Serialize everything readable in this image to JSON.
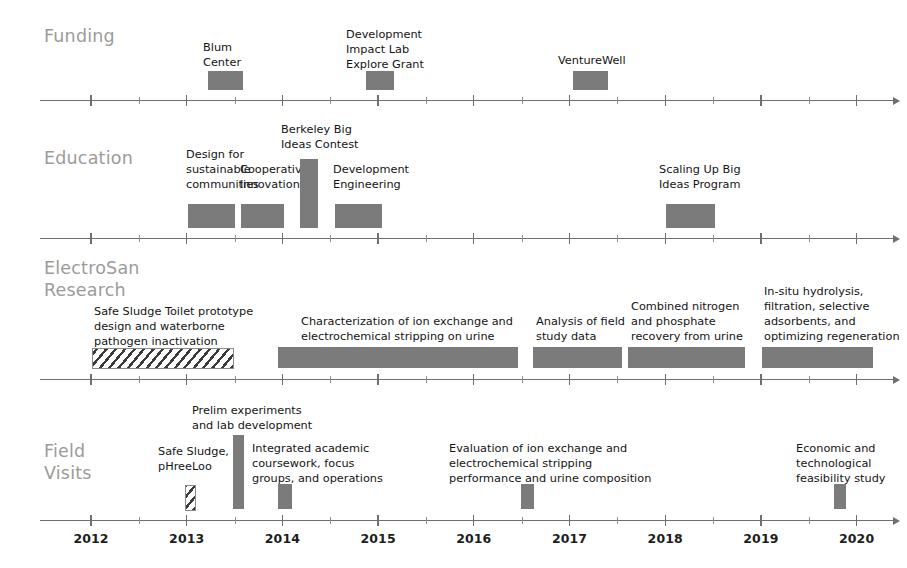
{
  "figure": {
    "title": "",
    "type": "timeline",
    "bar_color": "#7b7b7b",
    "label_color": "#9b9b9b",
    "axis_color": "#6f6f6f"
  },
  "axis": {
    "years": [
      "2012",
      "2013",
      "2014",
      "2015",
      "2016",
      "2017",
      "2018",
      "2019",
      "2020"
    ],
    "start_year": 2012,
    "end_year": 2020
  },
  "rows": [
    {
      "id": "funding",
      "label": "Funding",
      "items": [
        {
          "label": "Blum\nCenter",
          "start": 2013.24,
          "end": 2013.6
        },
        {
          "label": "Development\nImpact Lab\nExplore Grant",
          "start": 2014.93,
          "end": 2015.22
        },
        {
          "label": "VentureWell",
          "start": 2017.1,
          "end": 2017.47
        },
        {
          "label": "",
          "start": 0,
          "end": 0
        }
      ]
    },
    {
      "id": "education",
      "label": "Education",
      "items": [
        {
          "label": "Design for\nsustainable\ncommunities",
          "start": 2013.03,
          "end": 2013.53
        },
        {
          "label": "Cooperative\nInnovation",
          "start": 2013.59,
          "end": 2014.04
        },
        {
          "label": "Berkeley Big\nIdeas Contest",
          "start": 2014.21,
          "end": 2014.39
        },
        {
          "label": "Development\nEngineering",
          "start": 2014.58,
          "end": 2015.07
        }
      ],
      "items_right": [
        {
          "label": "Scaling Up Big\nIdeas Program",
          "start": 2018.09,
          "end": 2018.61
        }
      ]
    },
    {
      "id": "electrosan-research",
      "label": "ElectroSan\nResearch",
      "items": [
        {
          "label": "Safe Sludge Toilet prototype\ndesign and waterborne\npathogen inactivation",
          "start": 2012.03,
          "end": 2013.52,
          "style": "hatched"
        },
        {
          "label": "Characterization of ion exchange and\nelectrochemical stripping on urine",
          "start": 2013.99,
          "end": 2016.52
        },
        {
          "label": "Analysis of field\nstudy data",
          "start": 2016.68,
          "end": 2017.62
        },
        {
          "label": "Combined nitrogen\nand phosphate\nrecovery from urine",
          "start": 2017.68,
          "end": 2018.91
        },
        {
          "label": "In-situ hydrolysis,\nfiltration, selective\nadsorbents, and\noptimizing regeneration",
          "start": 2019.09,
          "end": 2020.26
        }
      ]
    },
    {
      "id": "field-visits",
      "label": "Field\nVisits",
      "items": [
        {
          "label": "Safe Sludge,\npHreeLoo",
          "start": 2012.99,
          "end": 2013.08,
          "style": "hatched"
        },
        {
          "label": "Prelim experiments\nand lab development",
          "start": 2013.54,
          "end": 2013.67,
          "tall": true
        },
        {
          "label": "Integrated academic\ncoursework, focus\ngroups, and operations",
          "start": 2014.0,
          "end": 2014.14
        },
        {
          "label": "Evaluation of ion exchange and\nelectrochemical stripping\nperformance and urine composition",
          "start": 2016.54,
          "end": 2016.68
        },
        {
          "label": "Economic and\ntechnological\nfeasibility study",
          "start": 2019.73,
          "end": 2019.85
        }
      ]
    }
  ]
}
